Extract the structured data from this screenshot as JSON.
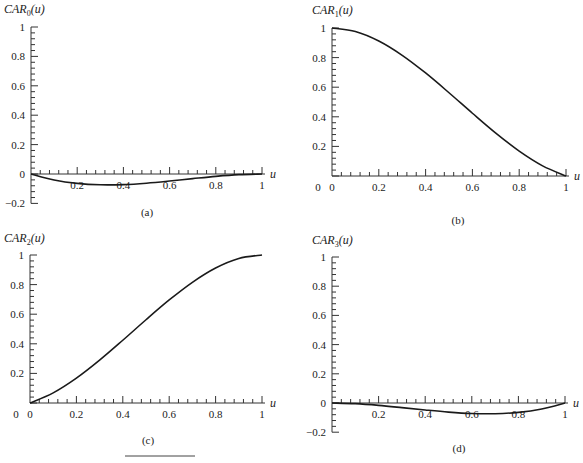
{
  "chart_data": [
    {
      "id": "a",
      "type": "line",
      "title": "CAR_0(u)",
      "ylabel_main": "CAR",
      "ylabel_sub": "0",
      "ylabel_tail": "(u)",
      "xlabel": "u",
      "panel_label": "(a)",
      "xlim": [
        0,
        1
      ],
      "ylim": [
        -0.2,
        1
      ],
      "xticks": [
        "0.2",
        "0.4",
        "0.6",
        "0.8",
        "1"
      ],
      "yticks": [
        "-0.2",
        "0",
        "0.2",
        "0.4",
        "0.6",
        "0.8",
        "1"
      ],
      "x": [
        0,
        0.1,
        0.2,
        0.3,
        0.4,
        0.5,
        0.6,
        0.7,
        0.8,
        0.9,
        1.0
      ],
      "values": [
        0,
        -0.0405,
        -0.064,
        -0.0735,
        -0.072,
        -0.0625,
        -0.048,
        -0.0315,
        -0.016,
        -0.0045,
        0
      ],
      "grid": false
    },
    {
      "id": "b",
      "type": "line",
      "title": "CAR_1(u)",
      "ylabel_main": "CAR",
      "ylabel_sub": "1",
      "ylabel_tail": "(u)",
      "xlabel": "u",
      "panel_label": "(b)",
      "xlim": [
        0,
        1
      ],
      "ylim": [
        0,
        1
      ],
      "xticks": [
        "0",
        "0.2",
        "0.4",
        "0.6",
        "0.8",
        "1"
      ],
      "yticks": [
        "0.2",
        "0.4",
        "0.6",
        "0.8",
        "1"
      ],
      "x": [
        0,
        0.1,
        0.2,
        0.3,
        0.4,
        0.5,
        0.6,
        0.7,
        0.8,
        0.9,
        1.0
      ],
      "values": [
        1,
        0.9765,
        0.912,
        0.8155,
        0.696,
        0.5625,
        0.424,
        0.2895,
        0.168,
        0.0685,
        0
      ],
      "grid": false
    },
    {
      "id": "c",
      "type": "line",
      "title": "CAR_2(u)",
      "ylabel_main": "CAR",
      "ylabel_sub": "2",
      "ylabel_tail": "(u)",
      "xlabel": "u",
      "panel_label": "(c)",
      "xlim": [
        0,
        1
      ],
      "ylim": [
        0,
        1
      ],
      "xticks": [
        "0",
        "0.2",
        "0.4",
        "0.6",
        "0.8",
        "1"
      ],
      "yticks": [
        "0.2",
        "0.4",
        "0.6",
        "0.8",
        "1"
      ],
      "x": [
        0,
        0.1,
        0.2,
        0.3,
        0.4,
        0.5,
        0.6,
        0.7,
        0.8,
        0.9,
        1.0
      ],
      "values": [
        0,
        0.0685,
        0.168,
        0.2895,
        0.424,
        0.5625,
        0.696,
        0.8155,
        0.912,
        0.9765,
        1
      ],
      "grid": false
    },
    {
      "id": "d",
      "type": "line",
      "title": "CAR_3(u)",
      "ylabel_main": "CAR",
      "ylabel_sub": "3",
      "ylabel_tail": "(u)",
      "xlabel": "u",
      "panel_label": "(d)",
      "xlim": [
        0,
        1
      ],
      "ylim": [
        -0.2,
        1
      ],
      "xticks": [
        "0.2",
        "0.4",
        "0.6",
        "0.8",
        "1"
      ],
      "yticks": [
        "-0.2",
        "0",
        "0.2",
        "0.4",
        "0.6",
        "0.8",
        "1"
      ],
      "x": [
        0,
        0.1,
        0.2,
        0.3,
        0.4,
        0.5,
        0.6,
        0.7,
        0.8,
        0.9,
        1.0
      ],
      "values": [
        0,
        -0.0045,
        -0.016,
        -0.0315,
        -0.048,
        -0.0625,
        -0.072,
        -0.0735,
        -0.064,
        -0.0405,
        0
      ],
      "grid": false
    }
  ],
  "layout": {
    "panels": [
      {
        "x0": 31,
        "x1": 262,
        "y_zero": 174,
        "y_one": 27,
        "label_x": 147,
        "label_y": 216,
        "title_x": 4,
        "title_y": 13
      },
      {
        "x0": 332,
        "x1": 566,
        "y_zero": 176,
        "y_one": 28,
        "label_x": 458,
        "label_y": 224,
        "title_x": 312,
        "title_y": 14
      },
      {
        "x0": 30,
        "x1": 262,
        "y_zero": 403,
        "y_one": 255,
        "label_x": 148,
        "label_y": 444,
        "title_x": 4,
        "title_y": 242
      },
      {
        "x0": 332,
        "x1": 565,
        "y_zero": 403,
        "y_one": 257,
        "label_x": 459,
        "label_y": 452,
        "title_x": 312,
        "title_y": 244
      }
    ],
    "footer_rule": {
      "x1": 125,
      "x2": 195,
      "y": 456
    }
  }
}
